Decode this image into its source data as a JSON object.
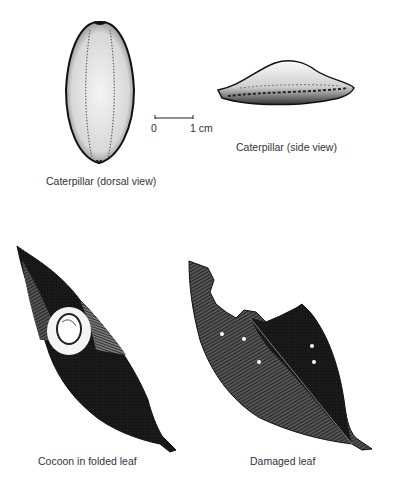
{
  "figure": {
    "panels": [
      {
        "id": "dorsal",
        "caption": "Caterpillar (dorsal view)"
      },
      {
        "id": "side",
        "caption": "Caterpillar (side view)"
      },
      {
        "id": "cocoon",
        "caption": "Cocoon in folded leaf"
      },
      {
        "id": "damaged",
        "caption": "Damaged leaf"
      }
    ],
    "scale_bar": {
      "start_label": "0",
      "end_label": "1 cm"
    },
    "colors": {
      "ink": "#111111",
      "paper": "#ffffff",
      "stipple": "#888888"
    }
  }
}
